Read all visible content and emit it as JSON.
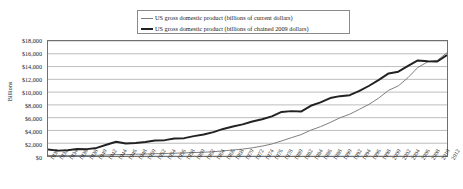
{
  "chart_data": {
    "type": "line",
    "title": "",
    "xlabel": "",
    "ylabel": "Billions",
    "xlim": [
      1930,
      2012
    ],
    "ylim": [
      0,
      18000
    ],
    "grid": true,
    "legend_position": "top-center",
    "ytick_labels": [
      "$18,000",
      "$16,000",
      "$14,000",
      "$12,000",
      "$10,000",
      "$8,000",
      "$6,000",
      "$4,000",
      "$2,000",
      "$0"
    ],
    "ytick_values": [
      18000,
      16000,
      14000,
      12000,
      10000,
      8000,
      6000,
      4000,
      2000,
      0
    ],
    "categories": [
      1930,
      1932,
      1934,
      1936,
      1938,
      1940,
      1942,
      1944,
      1946,
      1948,
      1950,
      1952,
      1954,
      1956,
      1958,
      1960,
      1962,
      1964,
      1966,
      1968,
      1970,
      1972,
      1974,
      1976,
      1978,
      1980,
      1982,
      1984,
      1986,
      1988,
      1990,
      1992,
      1994,
      1996,
      1998,
      2000,
      2002,
      2004,
      2006,
      2008,
      2010,
      2012
    ],
    "series": [
      {
        "name": "US gross domestic product (billions of current dollars)",
        "color": "#7d7d7d",
        "width": 1,
        "values": [
          92,
          59,
          66,
          84,
          87,
          103,
          162,
          224,
          223,
          270,
          300,
          360,
          391,
          438,
          475,
          543,
          586,
          671,
          799,
          942,
          1076,
          1283,
          1549,
          1874,
          2357,
          2862,
          3345,
          4040,
          4590,
          5252,
          5980,
          6539,
          7309,
          8100,
          9089,
          10285,
          10978,
          12277,
          13856,
          14719,
          14964,
          16163
        ]
      },
      {
        "name": "US gross domestic product (billions of chained 2009 dollars)",
        "color": "#222222",
        "width": 2,
        "values": [
          1027,
          843,
          904,
          1080,
          1072,
          1267,
          1765,
          2240,
          1961,
          2030,
          2184,
          2419,
          2481,
          2739,
          2793,
          3109,
          3362,
          3734,
          4239,
          4610,
          4952,
          5395,
          5753,
          6211,
          6897,
          7023,
          6949,
          7859,
          8387,
          9064,
          9366,
          9521,
          10183,
          10997,
          11907,
          12924,
          13199,
          14100,
          14952,
          14831,
          14784,
          15785
        ]
      }
    ]
  }
}
